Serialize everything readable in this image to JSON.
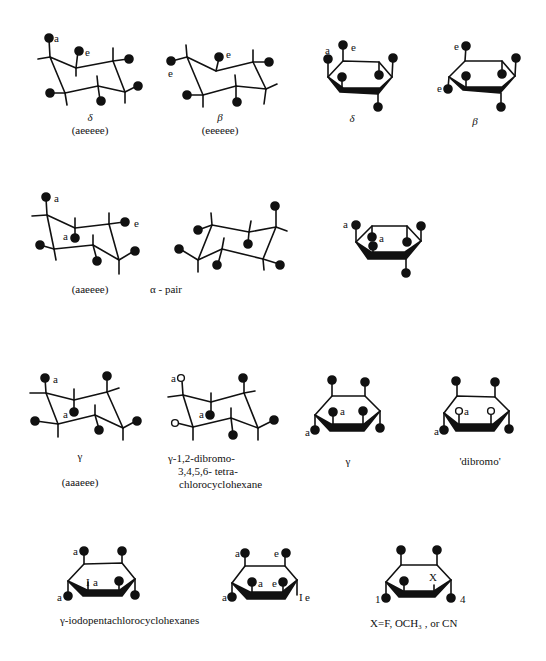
{
  "figure": {
    "ink_color": "#111111",
    "background": "#ffffff"
  },
  "row1": {
    "delta_chair": {
      "caption_greek": "δ",
      "caption_conf": "(aeeeee)",
      "labels": [
        "a",
        "e"
      ]
    },
    "beta_chair": {
      "caption_greek": "β",
      "caption_conf": "(eeeeee)",
      "labels": [
        "e",
        "e"
      ]
    },
    "delta_ring": {
      "caption_greek": "δ",
      "labels": [
        "a",
        "e"
      ]
    },
    "beta_ring": {
      "caption_greek": "β",
      "labels": [
        "e",
        "e"
      ]
    }
  },
  "row2": {
    "aaeeee_chair": {
      "caption_conf": "(aaeeee)",
      "labels": [
        "a",
        "a",
        "e"
      ]
    },
    "alpha_pair": {
      "caption": "α -  pair"
    },
    "alpha_ring": {
      "labels": [
        "a",
        "a"
      ]
    }
  },
  "row3": {
    "gamma_chair": {
      "caption_greek": "γ",
      "caption_conf": "(aaaeee)",
      "labels": [
        "a",
        "a"
      ]
    },
    "dibromo_chair": {
      "caption_lines": [
        "γ-1,2-dibromo-",
        "3,4,5,6- tetra-",
        "chlorocyclohexane"
      ],
      "labels": [
        "a",
        "a"
      ]
    },
    "gamma_ring": {
      "caption_greek": "γ",
      "labels": [
        "a",
        "a"
      ]
    },
    "dibromo_ring": {
      "caption": "'dibromo'",
      "labels": [
        "a",
        "a"
      ]
    }
  },
  "row4": {
    "iodo_ring_1": {
      "labels": [
        "a",
        "a",
        "I",
        "a"
      ]
    },
    "iodo_ring_2": {
      "labels": [
        "a",
        "e",
        "a",
        "e",
        "a",
        "I",
        "e"
      ]
    },
    "iodo_caption": "γ-iodopentachlorocyclohexanes",
    "x_ring": {
      "labels": [
        "X",
        "1",
        "4"
      ],
      "caption": "X=F, OCH₃ , or CN"
    }
  }
}
